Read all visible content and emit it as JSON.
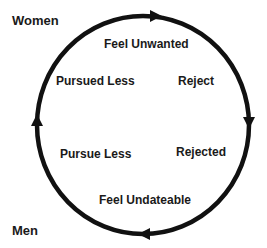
{
  "groups": {
    "top_left": "Women",
    "bottom_left": "Men"
  },
  "cycle": {
    "direction": "clockwise",
    "nodes": [
      {
        "id": "top",
        "label": "Feel Unwanted"
      },
      {
        "id": "upper_right",
        "label": "Reject"
      },
      {
        "id": "lower_right",
        "label": "Rejected"
      },
      {
        "id": "bottom",
        "label": "Feel Undateable"
      },
      {
        "id": "lower_left",
        "label": "Pursue Less"
      },
      {
        "id": "upper_left",
        "label": "Pursued Less"
      }
    ]
  },
  "colors": {
    "stroke": "#111111",
    "text": "#1a1a1a",
    "background": "#ffffff"
  }
}
